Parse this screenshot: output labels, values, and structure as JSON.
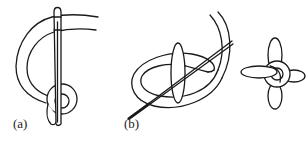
{
  "figure": {
    "background_color": "#ffffff",
    "line_color": "#1a1a1a",
    "panels": [
      {
        "id": "a",
        "label": "(a)"
      },
      {
        "id": "b",
        "label": "(b)"
      }
    ]
  }
}
